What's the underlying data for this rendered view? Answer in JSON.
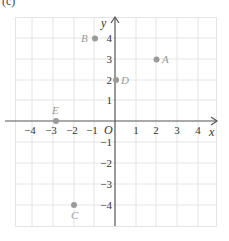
{
  "figure": {
    "panel_label": "(c)",
    "x_axis_label": "x",
    "y_axis_label": "y",
    "origin_label": "O",
    "x_ticks": [
      {
        "value": -4,
        "label": "−4"
      },
      {
        "value": -3,
        "label": "−3"
      },
      {
        "value": -2,
        "label": "−2"
      },
      {
        "value": -1,
        "label": "−1"
      },
      {
        "value": 1,
        "label": "1"
      },
      {
        "value": 2,
        "label": "2"
      },
      {
        "value": 3,
        "label": "3"
      },
      {
        "value": 4,
        "label": "4"
      }
    ],
    "y_ticks": [
      {
        "value": 4,
        "label": "4"
      },
      {
        "value": 3,
        "label": "3"
      },
      {
        "value": 2,
        "label": "2"
      },
      {
        "value": 1,
        "label": "1"
      },
      {
        "value": -1,
        "label": "−1"
      },
      {
        "value": -2,
        "label": "−2"
      },
      {
        "value": -3,
        "label": "−3"
      },
      {
        "value": -4,
        "label": "−4"
      }
    ],
    "points": [
      {
        "name": "A",
        "x": 2,
        "y": 3
      },
      {
        "name": "B",
        "x": -1,
        "y": 4
      },
      {
        "name": "C",
        "x": -2,
        "y": -4
      },
      {
        "name": "D",
        "x": 0,
        "y": 2
      },
      {
        "name": "E",
        "x": -3,
        "y": 0
      }
    ],
    "colors": {
      "grid": "#e4e4e4",
      "axis": "#555555",
      "point": "#9a9a9a",
      "point_label": "#9a9a9a",
      "tick_text": "#333333"
    }
  }
}
